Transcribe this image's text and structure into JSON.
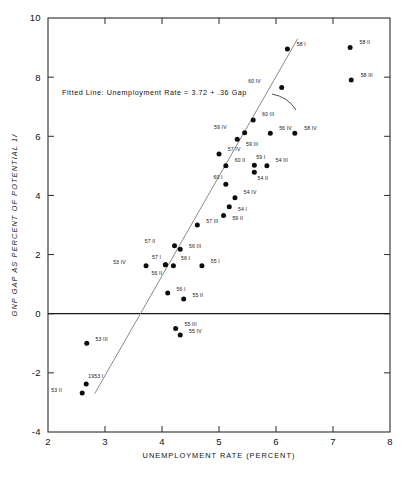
{
  "chart_data": {
    "type": "scatter",
    "title": "",
    "xlabel": "UNEMPLOYMENT RATE (PERCENT)",
    "ylabel": "GNP GAP AS PERCENT OF POTENTIAL 1/",
    "xlim": [
      2,
      8
    ],
    "ylim": [
      -4,
      10
    ],
    "xticks": [
      "2",
      "3",
      "4",
      "5",
      "6",
      "7",
      "8"
    ],
    "xtickvalues": [
      2,
      3,
      4,
      5,
      6,
      7,
      8
    ],
    "yticks": [
      "10",
      "8",
      "6",
      "4",
      "2",
      "0",
      "-2",
      "-4"
    ],
    "ytickvalues": [
      10,
      8,
      6,
      4,
      2,
      0,
      -2,
      -4
    ],
    "grid": false,
    "legend": "none",
    "zero_line": 0,
    "annotation": "Fitted Line: Unemployment Rate = 3.72 + .36 Gap",
    "fit": {
      "equation": "Unemployment Rate = 3.72 + .36 Gap",
      "intercept": 3.72,
      "slope_gap_on_u": 0.36,
      "x_start": 2.82,
      "y_start": -2.7,
      "x_end": 6.38,
      "y_end": 9.3
    },
    "points": [
      {
        "label": "58 I",
        "x": 6.2,
        "y": 8.95,
        "lx": 6.33,
        "ly": 9.12
      },
      {
        "label": "58 II",
        "x": 7.3,
        "y": 9.0,
        "lx": 7.43,
        "ly": 9.18
      },
      {
        "label": "58 III",
        "x": 7.32,
        "y": 7.9,
        "lx": 7.45,
        "ly": 8.07
      },
      {
        "label": "60 IV",
        "x": 6.1,
        "y": 7.65,
        "lx": 5.77,
        "ly": 7.85
      },
      {
        "label": "58 IV",
        "x": 6.33,
        "y": 6.1,
        "lx": 6.46,
        "ly": 6.28
      },
      {
        "label": "60 III",
        "x": 5.6,
        "y": 6.55,
        "lx": 5.72,
        "ly": 6.73
      },
      {
        "label": "59 IV",
        "x": 5.45,
        "y": 6.12,
        "lx": 5.17,
        "ly": 6.3
      },
      {
        "label": "59 III",
        "x": 5.32,
        "y": 5.9,
        "lx": 5.44,
        "ly": 5.74
      },
      {
        "label": "57 IV",
        "x": 5.0,
        "y": 5.4,
        "lx": 5.12,
        "ly": 5.58
      },
      {
        "label": "60 II",
        "x": 5.12,
        "y": 5.0,
        "lx": 5.24,
        "ly": 5.18
      },
      {
        "label": "59 I",
        "x": 5.62,
        "y": 5.02,
        "lx": 5.62,
        "ly": 5.28
      },
      {
        "label": "54 II",
        "x": 5.62,
        "y": 4.78,
        "lx": 5.64,
        "ly": 4.58
      },
      {
        "label": "54 III",
        "x": 5.84,
        "y": 5.0,
        "lx": 5.96,
        "ly": 5.18
      },
      {
        "label": "56 IV",
        "x": 5.9,
        "y": 6.1,
        "lx": 6.02,
        "ly": 6.28
      },
      {
        "label": "60 I",
        "x": 5.12,
        "y": 4.38,
        "lx": 5.1,
        "ly": 4.62
      },
      {
        "label": "54 IV",
        "x": 5.28,
        "y": 3.92,
        "lx": 5.4,
        "ly": 4.1
      },
      {
        "label": "54 I",
        "x": 5.18,
        "y": 3.62,
        "lx": 5.3,
        "ly": 3.52
      },
      {
        "label": "59 II",
        "x": 5.08,
        "y": 3.32,
        "lx": 5.2,
        "ly": 3.22
      },
      {
        "label": "57 III",
        "x": 4.62,
        "y": 3.0,
        "lx": 4.74,
        "ly": 3.14
      },
      {
        "label": "57 II",
        "x": 4.22,
        "y": 2.3,
        "lx": 3.92,
        "ly": 2.46
      },
      {
        "label": "56 III",
        "x": 4.32,
        "y": 2.18,
        "lx": 4.44,
        "ly": 2.3
      },
      {
        "label": "53 IV",
        "x": 3.72,
        "y": 1.62,
        "lx": 3.4,
        "ly": 1.74
      },
      {
        "label": "57 I",
        "x": 4.06,
        "y": 1.66,
        "lx": 4.02,
        "ly": 1.92
      },
      {
        "label": "56 II",
        "x": 4.06,
        "y": 1.66,
        "lx": 4.04,
        "ly": 1.38
      },
      {
        "label": "56 I",
        "x": 4.2,
        "y": 1.62,
        "lx": 4.3,
        "ly": 1.88
      },
      {
        "label": "55 I",
        "x": 4.7,
        "y": 1.62,
        "lx": 4.82,
        "ly": 1.76
      },
      {
        "label": "56 I",
        "x": 4.1,
        "y": 0.7,
        "lx": 4.22,
        "ly": 0.84
      },
      {
        "label": "55 II",
        "x": 4.38,
        "y": 0.5,
        "lx": 4.5,
        "ly": 0.64
      },
      {
        "label": "55 III",
        "x": 4.24,
        "y": -0.5,
        "lx": 4.36,
        "ly": -0.36
      },
      {
        "label": "55 IV",
        "x": 4.32,
        "y": -0.72,
        "lx": 4.44,
        "ly": -0.6
      },
      {
        "label": "53 III",
        "x": 2.68,
        "y": -1.0,
        "lx": 2.8,
        "ly": -0.86
      },
      {
        "label": "1953 I",
        "x": 2.67,
        "y": -2.38,
        "lx": 2.67,
        "ly": -2.12
      },
      {
        "label": "53 II",
        "x": 2.6,
        "y": -2.68,
        "lx": 2.28,
        "ly": -2.58
      }
    ]
  },
  "caption": {
    "bottom_text": ""
  }
}
